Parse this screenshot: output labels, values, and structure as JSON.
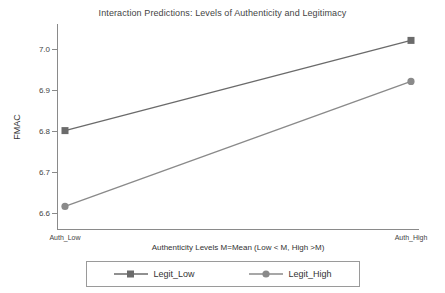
{
  "chart_data": {
    "type": "line",
    "title": "Interaction Predictions: Levels of Authenticity and Legitimacy",
    "xlabel": "Authenticity Levels M=Mean (Low < M, High >M)",
    "ylabel": "FMAC",
    "categories": [
      "Auth_Low",
      "Auth_High"
    ],
    "series": [
      {
        "name": "Legit_Low",
        "values": [
          6.8,
          7.02
        ],
        "color": "#6b6b6b",
        "marker": "square"
      },
      {
        "name": "Legit_High",
        "values": [
          6.615,
          6.92
        ],
        "color": "#8a8a8a",
        "marker": "circle"
      }
    ],
    "yticks": [
      "6.6",
      "6.7",
      "6.8",
      "6.9",
      "7.0"
    ],
    "ytick_values": [
      6.6,
      6.7,
      6.8,
      6.9,
      7.0
    ],
    "ylim": [
      6.56,
      7.06
    ],
    "grid": false,
    "legend_position": "bottom"
  },
  "legend": {
    "items": [
      {
        "label": "Legit_Low"
      },
      {
        "label": "Legit_High"
      }
    ]
  }
}
